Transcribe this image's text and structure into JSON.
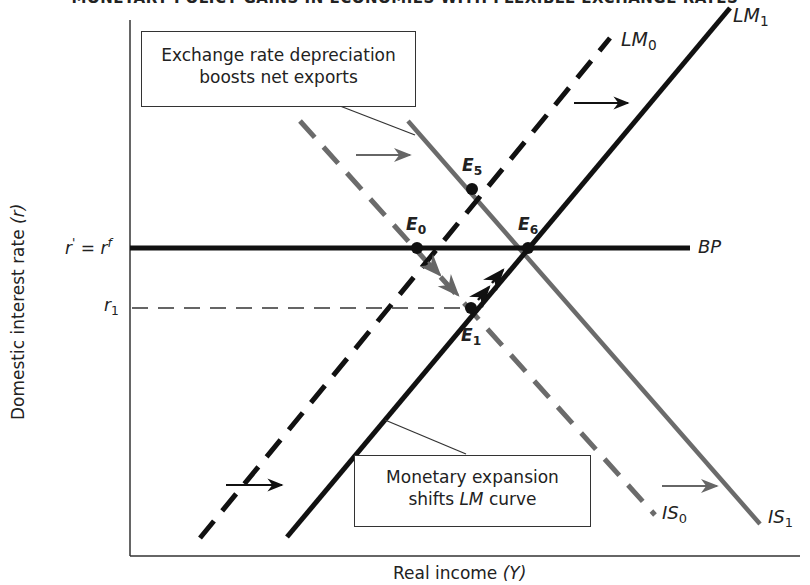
{
  "header": {
    "title": "MONETARY POLICY GAINS IN ECONOMIES WITH FLEXIBLE EXCHANGE RATES"
  },
  "axes": {
    "y_title": "Domestic interest rate",
    "y_symbol": "(r)",
    "x_title": "Real income",
    "x_symbol": "(Y)",
    "y_ticks": [
      {
        "label_main": "r",
        "label_prime": "'",
        "label_eq": " = r",
        "label_sup": "f",
        "name": "r-prime-equals-r-f"
      },
      {
        "label_main": "r",
        "label_sub": "1",
        "name": "r1"
      }
    ]
  },
  "curves": {
    "LM0": {
      "main": "LM",
      "sub": "0",
      "style": "dashed",
      "color": "#111111"
    },
    "LM1": {
      "main": "LM",
      "sub": "1",
      "style": "solid",
      "color": "#111111"
    },
    "IS0": {
      "main": "IS",
      "sub": "0",
      "style": "dashed",
      "color": "#6b6b6b"
    },
    "IS1": {
      "main": "IS",
      "sub": "1",
      "style": "solid",
      "color": "#6b6b6b"
    },
    "BP": {
      "main": "BP",
      "style": "solid",
      "color": "#111111"
    }
  },
  "points": {
    "E0": {
      "main": "E",
      "sub": "0"
    },
    "E1": {
      "main": "E",
      "sub": "1"
    },
    "E5": {
      "main": "E",
      "sub": "5"
    },
    "E6": {
      "main": "E",
      "sub": "6"
    }
  },
  "annotations": {
    "top_box": {
      "line1": "Exchange rate depreciation",
      "line2": "boosts net exports"
    },
    "bottom_box": {
      "line1": "Monetary expansion",
      "line2_pre": "shifts ",
      "line2_ital": "LM",
      "line2_post": " curve"
    }
  },
  "colors": {
    "black_line": "#111111",
    "gray_line": "#6b6b6b",
    "axis": "#333333"
  }
}
